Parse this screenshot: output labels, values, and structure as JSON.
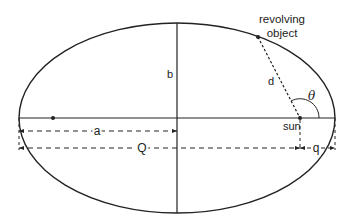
{
  "diagram": {
    "type": "orbital-ellipse",
    "colors": {
      "stroke": "#222222",
      "background": "#ffffff"
    },
    "labels": {
      "revolving_object_line1": "revolving",
      "revolving_object_line2": "object",
      "semi_major": "a",
      "semi_minor": "b",
      "distance": "d",
      "angle": "θ",
      "sun": "sun",
      "aphelion": "Q",
      "perihelion": "q"
    }
  }
}
